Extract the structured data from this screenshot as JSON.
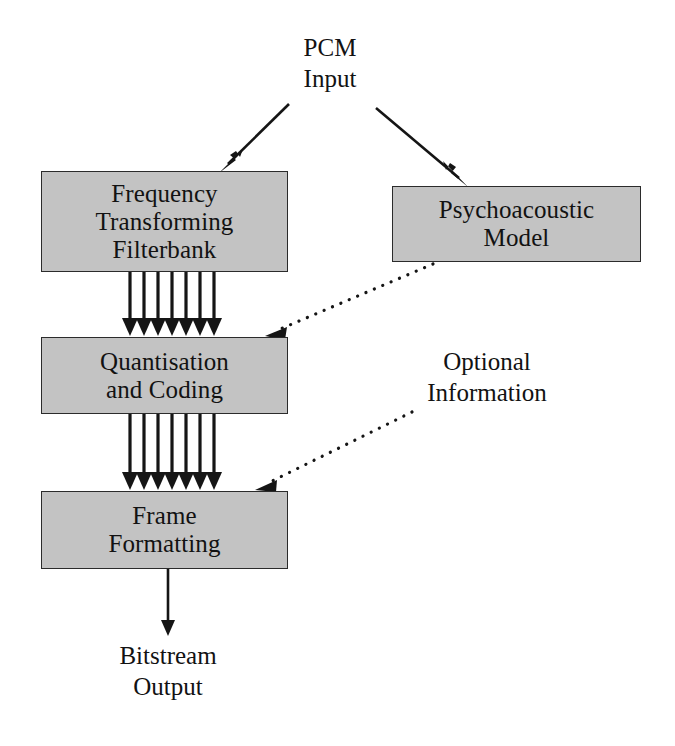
{
  "diagram": {
    "colors": {
      "block_fill": "#c3c3c3",
      "block_border": "#2b2b2b",
      "line": "#151515",
      "background": "#ffffff"
    },
    "blocks": [
      {
        "id": "filterbank",
        "lines": [
          "Frequency",
          "Transforming",
          "Filterbank"
        ],
        "line1": "Frequency",
        "line2": "Transforming",
        "line3": "Filterbank"
      },
      {
        "id": "psychoacoustic",
        "lines": [
          "Psychoacoustic",
          "Model"
        ],
        "line1": "Psychoacoustic",
        "line2": "Model"
      },
      {
        "id": "quantisation",
        "lines": [
          "Quantisation",
          "and Coding"
        ],
        "line1": "Quantisation",
        "line2": "and Coding"
      },
      {
        "id": "frame",
        "lines": [
          "Frame",
          "Formatting"
        ],
        "line1": "Frame",
        "line2": "Formatting"
      }
    ],
    "labels": {
      "pcm_input": {
        "line1": "PCM",
        "line2": "Input"
      },
      "optional_information": {
        "line1": "Optional",
        "line2": "Information"
      },
      "bitstream_output": {
        "line1": "Bitstream",
        "line2": "Output"
      }
    },
    "connectors": [
      {
        "id": "pcm-to-filterbank",
        "style": "solid-arrow",
        "from": "PCM Input",
        "to": "Frequency Transforming Filterbank"
      },
      {
        "id": "pcm-to-psychoacoustic",
        "style": "solid-arrow",
        "from": "PCM Input",
        "to": "Psychoacoustic Model"
      },
      {
        "id": "filterbank-to-quantisation",
        "style": "parallel-arrow-bus",
        "arrow_count": 7,
        "from": "Frequency Transforming Filterbank",
        "to": "Quantisation and Coding"
      },
      {
        "id": "psychoacoustic-to-quantisation",
        "style": "dotted-arrow",
        "from": "Psychoacoustic Model",
        "to": "Quantisation and Coding"
      },
      {
        "id": "quantisation-to-frame",
        "style": "parallel-arrow-bus",
        "arrow_count": 7,
        "from": "Quantisation and Coding",
        "to": "Frame Formatting"
      },
      {
        "id": "optional-information-to-frame",
        "style": "dotted-arrow",
        "from": "Optional Information",
        "to": "Frame Formatting"
      },
      {
        "id": "frame-to-bitstream",
        "style": "solid-arrow",
        "from": "Frame Formatting",
        "to": "Bitstream Output"
      }
    ]
  }
}
